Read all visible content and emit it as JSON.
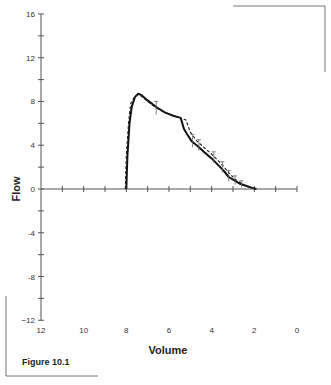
{
  "figure": {
    "caption": "Figure 10.1"
  },
  "chart_data": {
    "type": "line",
    "title": "",
    "xlabel": "Volume",
    "ylabel": "Flow",
    "xlim": [
      12,
      0
    ],
    "ylim": [
      -12,
      16
    ],
    "x_reversed": true,
    "x_ticks": [
      12,
      10,
      8,
      6,
      4,
      2,
      0
    ],
    "x_minor_step": 1,
    "y_ticks": [
      16,
      12,
      8,
      4,
      0,
      -4,
      -8,
      -12
    ],
    "y_tick_labels": [
      "16",
      "12",
      "8",
      "4",
      "0",
      "-4",
      "-8",
      "−12"
    ],
    "y_minor_step": 2,
    "grid": false,
    "legend": null,
    "series": [
      {
        "name": "solid",
        "style": "solid",
        "color": "#111111",
        "points": [
          [
            8.0,
            0
          ],
          [
            7.95,
            3.0
          ],
          [
            7.85,
            6.0
          ],
          [
            7.75,
            7.5
          ],
          [
            7.6,
            8.4
          ],
          [
            7.45,
            8.7
          ],
          [
            7.3,
            8.6
          ],
          [
            7.0,
            8.1
          ],
          [
            6.6,
            7.5
          ],
          [
            6.2,
            7.0
          ],
          [
            5.8,
            6.7
          ],
          [
            5.45,
            6.5
          ],
          [
            5.3,
            5.5
          ],
          [
            5.15,
            5.0
          ],
          [
            4.95,
            4.4
          ],
          [
            4.65,
            3.9
          ],
          [
            4.3,
            3.3
          ],
          [
            4.0,
            2.8
          ],
          [
            3.7,
            2.2
          ],
          [
            3.45,
            1.7
          ],
          [
            3.2,
            1.1
          ],
          [
            2.95,
            0.8
          ],
          [
            2.7,
            0.5
          ],
          [
            2.4,
            0.3
          ],
          [
            2.1,
            0.1
          ],
          [
            1.9,
            0.0
          ]
        ]
      },
      {
        "name": "dashed",
        "style": "dashed",
        "color": "#222222",
        "points": [
          [
            8.05,
            0
          ],
          [
            8.0,
            3.0
          ],
          [
            7.9,
            6.0
          ],
          [
            7.8,
            7.8
          ],
          [
            7.6,
            8.5
          ],
          [
            7.45,
            8.6
          ],
          [
            7.3,
            8.5
          ],
          [
            7.0,
            8.0
          ],
          [
            6.6,
            7.4
          ],
          [
            6.2,
            7.0
          ],
          [
            5.8,
            6.7
          ],
          [
            5.45,
            6.5
          ],
          [
            5.2,
            6.3
          ],
          [
            5.0,
            5.2
          ],
          [
            4.7,
            4.4
          ],
          [
            4.3,
            3.7
          ],
          [
            3.9,
            3.0
          ],
          [
            3.5,
            2.2
          ],
          [
            3.2,
            1.5
          ],
          [
            2.9,
            0.9
          ],
          [
            2.6,
            0.5
          ],
          [
            2.3,
            0.2
          ],
          [
            2.0,
            0.05
          ]
        ]
      }
    ],
    "error_bars": [
      {
        "x": 6.6,
        "y": 7.4,
        "dy": 0.6
      },
      {
        "x": 4.9,
        "y": 4.4,
        "dy": 0.6
      },
      {
        "x": 4.6,
        "y": 4.0,
        "dy": 0.5
      },
      {
        "x": 3.9,
        "y": 2.9,
        "dy": 0.5
      },
      {
        "x": 3.5,
        "y": 2.0,
        "dy": 0.5
      },
      {
        "x": 3.2,
        "y": 1.2,
        "dy": 0.5
      },
      {
        "x": 2.9,
        "y": 0.8,
        "dy": 0.4
      },
      {
        "x": 2.6,
        "y": 0.45,
        "dy": 0.3
      }
    ]
  }
}
